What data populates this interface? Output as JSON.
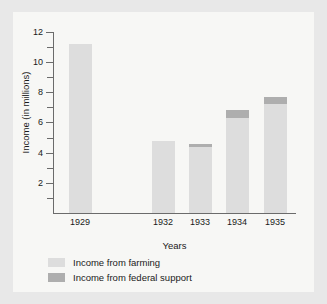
{
  "chart_data": {
    "type": "bar",
    "stacked": true,
    "title": "",
    "xlabel": "Years",
    "ylabel": "Income (in millions)",
    "categories": [
      "1929",
      "1932",
      "1933",
      "1934",
      "1935"
    ],
    "series": [
      {
        "name": "Income from farming",
        "color": "#dddddd",
        "values": [
          11.2,
          4.75,
          4.4,
          6.3,
          7.2
        ]
      },
      {
        "name": "Income from federal support",
        "color": "#aeaeae",
        "values": [
          0,
          0,
          0.15,
          0.5,
          0.5
        ]
      }
    ],
    "ylim": [
      0,
      12
    ],
    "ytick_labels": [
      "2",
      "4",
      "6",
      "8",
      "10",
      "12"
    ],
    "ytick_values": [
      2,
      4,
      6,
      8,
      10,
      12
    ],
    "yminor_values": [
      1,
      3,
      5,
      7,
      9,
      11
    ],
    "grid": false,
    "legend_position": "bottom-left",
    "category_gap_after": "1929"
  },
  "legend": {
    "items": [
      {
        "label": "Income from farming",
        "color": "#dddddd"
      },
      {
        "label": "Income from federal support",
        "color": "#aeaeae"
      }
    ]
  },
  "colors": {
    "page_background": "#e8e8e8",
    "figure_background": "#f7f7f5",
    "axis": "#6b6b6b",
    "text": "#1a1a1a",
    "farming": "#dddddd",
    "federal": "#aeaeae"
  }
}
